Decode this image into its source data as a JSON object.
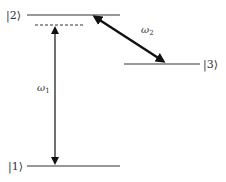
{
  "diagram": {
    "type": "energy-level-diagram",
    "levels": [
      {
        "id": "level-2",
        "label": "|2⟩",
        "y": 15
      },
      {
        "id": "level-3",
        "label": "|3⟩",
        "y": 64
      },
      {
        "id": "level-1",
        "label": "|1⟩",
        "y": 166
      }
    ],
    "transitions": [
      {
        "id": "omega-1",
        "symbol": "ω",
        "subscript": "1",
        "from": "|1⟩",
        "to": "virtual level near |2⟩",
        "style": "double-headed vertical arrow"
      },
      {
        "id": "omega-2",
        "symbol": "ω",
        "subscript": "2",
        "from": "|2⟩",
        "to": "|3⟩",
        "style": "bold double-headed diagonal arrow"
      }
    ],
    "virtual_level": {
      "style": "dashed",
      "position": "just below |2⟩"
    },
    "colors": {
      "line": "#333333",
      "arrow": "#111111",
      "background": "#ffffff"
    }
  }
}
